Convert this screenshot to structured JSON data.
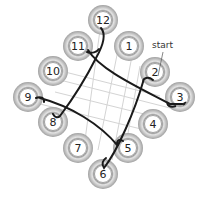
{
  "diagram": {
    "title": "",
    "start_label": "start",
    "rings": [
      {
        "label": "12",
        "x": 103,
        "y": 20
      },
      {
        "label": "1",
        "x": 129,
        "y": 46
      },
      {
        "label": "11",
        "x": 78,
        "y": 46
      },
      {
        "label": "2",
        "x": 155,
        "y": 72
      },
      {
        "label": "10",
        "x": 53,
        "y": 71
      },
      {
        "label": "3",
        "x": 180,
        "y": 97
      },
      {
        "label": "9",
        "x": 28,
        "y": 97
      },
      {
        "label": "4",
        "x": 153,
        "y": 124
      },
      {
        "label": "8",
        "x": 53,
        "y": 122
      },
      {
        "label": "5",
        "x": 128,
        "y": 148
      },
      {
        "label": "7",
        "x": 78,
        "y": 148
      },
      {
        "label": "6",
        "x": 103,
        "y": 174
      }
    ],
    "colors": {
      "ring_outer": "#a8a8a8",
      "ring_mid": "#d8d8d8",
      "ring_inner": "#ffffff",
      "strand": "#1a1a1a",
      "grid": "#d0d0d0"
    }
  }
}
